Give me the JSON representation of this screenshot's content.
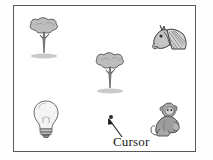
{
  "scene": {
    "title": "cursor-on-object-grid",
    "background_color": "#ffffff",
    "frame_color": "#5a5a5a"
  },
  "objects": [
    {
      "id": "tree-top-left",
      "icon": "tree-icon",
      "label": "Tree",
      "x": 22,
      "y": 17,
      "w": 44,
      "h": 44
    },
    {
      "id": "horse-top-right",
      "icon": "horse-icon",
      "label": "Horse head",
      "x": 150,
      "y": 19,
      "w": 42,
      "h": 40
    },
    {
      "id": "tree-middle",
      "icon": "tree-icon",
      "label": "Tree",
      "x": 88,
      "y": 52,
      "w": 44,
      "h": 44
    },
    {
      "id": "bulb-bottom-left",
      "icon": "bulb-icon",
      "label": "Light bulb",
      "x": 30,
      "y": 99,
      "w": 32,
      "h": 40
    },
    {
      "id": "monkey-bottom-right",
      "icon": "monkey-icon",
      "label": "Monkey",
      "x": 148,
      "y": 99,
      "w": 42,
      "h": 40
    }
  ],
  "cursor": {
    "label": "Cursor",
    "dot_x": 109,
    "dot_y": 115,
    "dot_color": "#2b2b2b",
    "label_x": 113,
    "label_y": 136
  }
}
